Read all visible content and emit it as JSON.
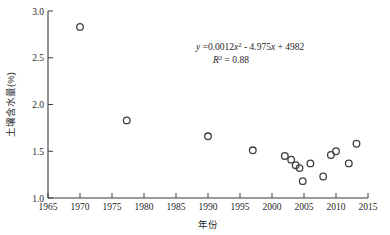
{
  "chart_data": {
    "type": "scatter",
    "title": "",
    "xlabel": "年份",
    "ylabel": "土壤含水量(%)",
    "xlim": [
      1965,
      2015
    ],
    "ylim": [
      1.0,
      3.0
    ],
    "xticks": [
      1965,
      1970,
      1975,
      1980,
      1985,
      1990,
      1995,
      2000,
      2005,
      2010,
      2015
    ],
    "xtick_labels": [
      "1965",
      "1970",
      "1975",
      "1980",
      "1985",
      "1990",
      "1995",
      "2000",
      "2005",
      "2010",
      "2015"
    ],
    "yticks": [
      1.0,
      1.5,
      2.0,
      2.5,
      3.0
    ],
    "ytick_labels": [
      "1.0",
      "1.5",
      "2.0",
      "2.5",
      "3.0"
    ],
    "grid": false,
    "legend": null,
    "marker_style": "open-circle",
    "points": [
      {
        "x": 1970.0,
        "y": 2.83
      },
      {
        "x": 1977.3,
        "y": 1.83
      },
      {
        "x": 1990.0,
        "y": 1.66
      },
      {
        "x": 1997.0,
        "y": 1.51
      },
      {
        "x": 2002.0,
        "y": 1.45
      },
      {
        "x": 2003.0,
        "y": 1.41
      },
      {
        "x": 2003.7,
        "y": 1.35
      },
      {
        "x": 2004.3,
        "y": 1.32
      },
      {
        "x": 2004.8,
        "y": 1.18
      },
      {
        "x": 2006.0,
        "y": 1.37
      },
      {
        "x": 2008.0,
        "y": 1.23
      },
      {
        "x": 2009.2,
        "y": 1.46
      },
      {
        "x": 2010.0,
        "y": 1.5
      },
      {
        "x": 2012.0,
        "y": 1.37
      },
      {
        "x": 2013.2,
        "y": 1.58
      }
    ],
    "trendline": {
      "type": "quadratic",
      "a": 0.0012,
      "b": -4.975,
      "c": 4982,
      "x_start": 1968.5,
      "x_end": 2013.5,
      "r_squared": 0.88
    },
    "annotations": {
      "equation_y": "y",
      "equation_eq": " =0.0012",
      "equation_x1": "x",
      "equation_sup1": "2",
      "equation_mid": " - 4.975",
      "equation_x2": "x",
      "equation_tail": " + 4982",
      "r2_label": "R",
      "r2_sup": "2",
      "r2_value": " = 0.88"
    }
  }
}
